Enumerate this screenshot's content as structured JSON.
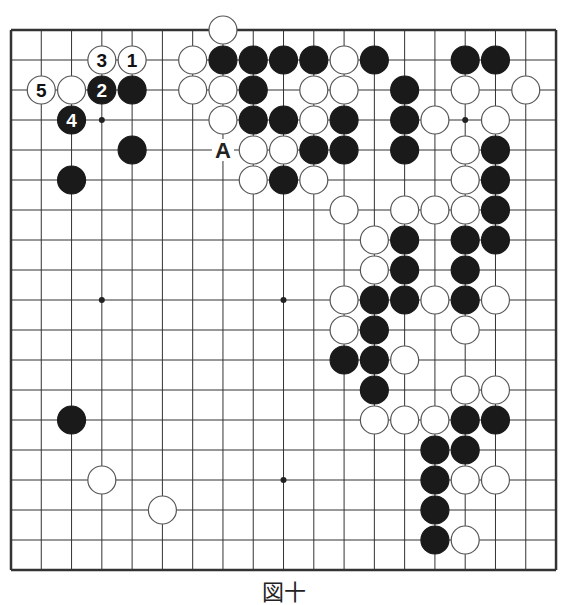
{
  "diagram": {
    "type": "go-board",
    "size": 19,
    "caption": "図十",
    "colors": {
      "black": "#1a1a1a",
      "white": "#ffffff",
      "line": "#333333"
    },
    "hoshi": [
      [
        3,
        3
      ],
      [
        9,
        3
      ],
      [
        15,
        3
      ],
      [
        3,
        9
      ],
      [
        9,
        9
      ],
      [
        15,
        9
      ],
      [
        3,
        15
      ],
      [
        9,
        15
      ],
      [
        15,
        15
      ]
    ],
    "stones": [
      {
        "c": 7,
        "r": 0,
        "color": "white"
      },
      {
        "c": 3,
        "r": 1,
        "color": "white",
        "label": "3"
      },
      {
        "c": 4,
        "r": 1,
        "color": "white",
        "label": "1"
      },
      {
        "c": 6,
        "r": 1,
        "color": "white"
      },
      {
        "c": 7,
        "r": 1,
        "color": "black"
      },
      {
        "c": 8,
        "r": 1,
        "color": "black"
      },
      {
        "c": 9,
        "r": 1,
        "color": "black"
      },
      {
        "c": 10,
        "r": 1,
        "color": "black"
      },
      {
        "c": 11,
        "r": 1,
        "color": "white"
      },
      {
        "c": 12,
        "r": 1,
        "color": "black"
      },
      {
        "c": 15,
        "r": 1,
        "color": "black"
      },
      {
        "c": 16,
        "r": 1,
        "color": "black"
      },
      {
        "c": 1,
        "r": 2,
        "color": "white",
        "label": "5"
      },
      {
        "c": 2,
        "r": 2,
        "color": "white"
      },
      {
        "c": 3,
        "r": 2,
        "color": "black",
        "label": "2"
      },
      {
        "c": 4,
        "r": 2,
        "color": "black"
      },
      {
        "c": 6,
        "r": 2,
        "color": "white"
      },
      {
        "c": 7,
        "r": 2,
        "color": "white"
      },
      {
        "c": 8,
        "r": 2,
        "color": "black"
      },
      {
        "c": 10,
        "r": 2,
        "color": "white"
      },
      {
        "c": 11,
        "r": 2,
        "color": "white"
      },
      {
        "c": 13,
        "r": 2,
        "color": "black"
      },
      {
        "c": 15,
        "r": 2,
        "color": "white"
      },
      {
        "c": 17,
        "r": 2,
        "color": "white"
      },
      {
        "c": 2,
        "r": 3,
        "color": "black",
        "label": "4"
      },
      {
        "c": 7,
        "r": 3,
        "color": "white"
      },
      {
        "c": 8,
        "r": 3,
        "color": "black"
      },
      {
        "c": 9,
        "r": 3,
        "color": "black"
      },
      {
        "c": 10,
        "r": 3,
        "color": "white"
      },
      {
        "c": 11,
        "r": 3,
        "color": "black"
      },
      {
        "c": 13,
        "r": 3,
        "color": "black"
      },
      {
        "c": 14,
        "r": 3,
        "color": "white"
      },
      {
        "c": 16,
        "r": 3,
        "color": "white"
      },
      {
        "c": 4,
        "r": 4,
        "color": "black"
      },
      {
        "c": 8,
        "r": 4,
        "color": "white"
      },
      {
        "c": 9,
        "r": 4,
        "color": "white"
      },
      {
        "c": 10,
        "r": 4,
        "color": "black"
      },
      {
        "c": 11,
        "r": 4,
        "color": "black"
      },
      {
        "c": 13,
        "r": 4,
        "color": "black"
      },
      {
        "c": 15,
        "r": 4,
        "color": "white"
      },
      {
        "c": 16,
        "r": 4,
        "color": "black"
      },
      {
        "c": 2,
        "r": 5,
        "color": "black"
      },
      {
        "c": 8,
        "r": 5,
        "color": "white"
      },
      {
        "c": 9,
        "r": 5,
        "color": "black"
      },
      {
        "c": 10,
        "r": 5,
        "color": "white"
      },
      {
        "c": 15,
        "r": 5,
        "color": "white"
      },
      {
        "c": 16,
        "r": 5,
        "color": "black"
      },
      {
        "c": 11,
        "r": 6,
        "color": "white"
      },
      {
        "c": 13,
        "r": 6,
        "color": "white"
      },
      {
        "c": 14,
        "r": 6,
        "color": "white"
      },
      {
        "c": 15,
        "r": 6,
        "color": "white"
      },
      {
        "c": 16,
        "r": 6,
        "color": "black"
      },
      {
        "c": 12,
        "r": 7,
        "color": "white"
      },
      {
        "c": 13,
        "r": 7,
        "color": "black"
      },
      {
        "c": 15,
        "r": 7,
        "color": "black"
      },
      {
        "c": 16,
        "r": 7,
        "color": "black"
      },
      {
        "c": 12,
        "r": 8,
        "color": "white"
      },
      {
        "c": 13,
        "r": 8,
        "color": "black"
      },
      {
        "c": 15,
        "r": 8,
        "color": "black"
      },
      {
        "c": 11,
        "r": 9,
        "color": "white"
      },
      {
        "c": 12,
        "r": 9,
        "color": "black"
      },
      {
        "c": 13,
        "r": 9,
        "color": "black"
      },
      {
        "c": 14,
        "r": 9,
        "color": "white"
      },
      {
        "c": 15,
        "r": 9,
        "color": "black"
      },
      {
        "c": 16,
        "r": 9,
        "color": "white"
      },
      {
        "c": 11,
        "r": 10,
        "color": "white"
      },
      {
        "c": 12,
        "r": 10,
        "color": "black"
      },
      {
        "c": 15,
        "r": 10,
        "color": "white"
      },
      {
        "c": 11,
        "r": 11,
        "color": "black"
      },
      {
        "c": 12,
        "r": 11,
        "color": "black"
      },
      {
        "c": 13,
        "r": 11,
        "color": "white"
      },
      {
        "c": 12,
        "r": 12,
        "color": "black"
      },
      {
        "c": 15,
        "r": 12,
        "color": "white"
      },
      {
        "c": 16,
        "r": 12,
        "color": "white"
      },
      {
        "c": 2,
        "r": 13,
        "color": "black"
      },
      {
        "c": 12,
        "r": 13,
        "color": "white"
      },
      {
        "c": 13,
        "r": 13,
        "color": "white"
      },
      {
        "c": 14,
        "r": 13,
        "color": "white"
      },
      {
        "c": 15,
        "r": 13,
        "color": "black"
      },
      {
        "c": 16,
        "r": 13,
        "color": "black"
      },
      {
        "c": 14,
        "r": 14,
        "color": "black"
      },
      {
        "c": 15,
        "r": 14,
        "color": "black"
      },
      {
        "c": 3,
        "r": 15,
        "color": "white"
      },
      {
        "c": 14,
        "r": 15,
        "color": "black"
      },
      {
        "c": 15,
        "r": 15,
        "color": "white"
      },
      {
        "c": 16,
        "r": 15,
        "color": "white"
      },
      {
        "c": 5,
        "r": 16,
        "color": "white"
      },
      {
        "c": 14,
        "r": 16,
        "color": "black"
      },
      {
        "c": 14,
        "r": 17,
        "color": "black"
      },
      {
        "c": 15,
        "r": 17,
        "color": "white"
      }
    ],
    "marks": [
      {
        "c": 7,
        "r": 4,
        "label": "A"
      }
    ]
  }
}
